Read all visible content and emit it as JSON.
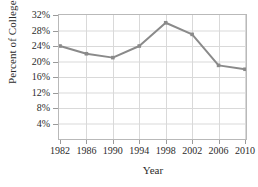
{
  "figure": {
    "title_partial": "",
    "caption_partial": ""
  },
  "chart_data": {
    "type": "line",
    "title": "",
    "xlabel": "Year",
    "ylabel": "Percent of College Students",
    "categories": [
      "1982",
      "1986",
      "1990",
      "1994",
      "1998",
      "2002",
      "2006",
      "2010"
    ],
    "x": [
      1982,
      1986,
      1990,
      1994,
      1998,
      2002,
      2006,
      2010
    ],
    "values": [
      24,
      22,
      21,
      24,
      30,
      27,
      19,
      18
    ],
    "ylim": [
      0,
      32
    ],
    "xlim": [
      1982,
      2010
    ],
    "ytick_labels": [
      "4%",
      "8%",
      "12%",
      "16%",
      "20%",
      "24%",
      "28%",
      "32%"
    ],
    "ytick_values": [
      4,
      8,
      12,
      16,
      20,
      24,
      28,
      32
    ],
    "xtick_labels": [
      "1982",
      "1986",
      "1990",
      "1994",
      "1998",
      "2002",
      "2006",
      "2010"
    ],
    "grid": true,
    "legend": false,
    "marker": "square",
    "series_color": "#8a8a8a",
    "grid_color": "#d9d9d9",
    "frame_color": "#b9b9b9"
  }
}
